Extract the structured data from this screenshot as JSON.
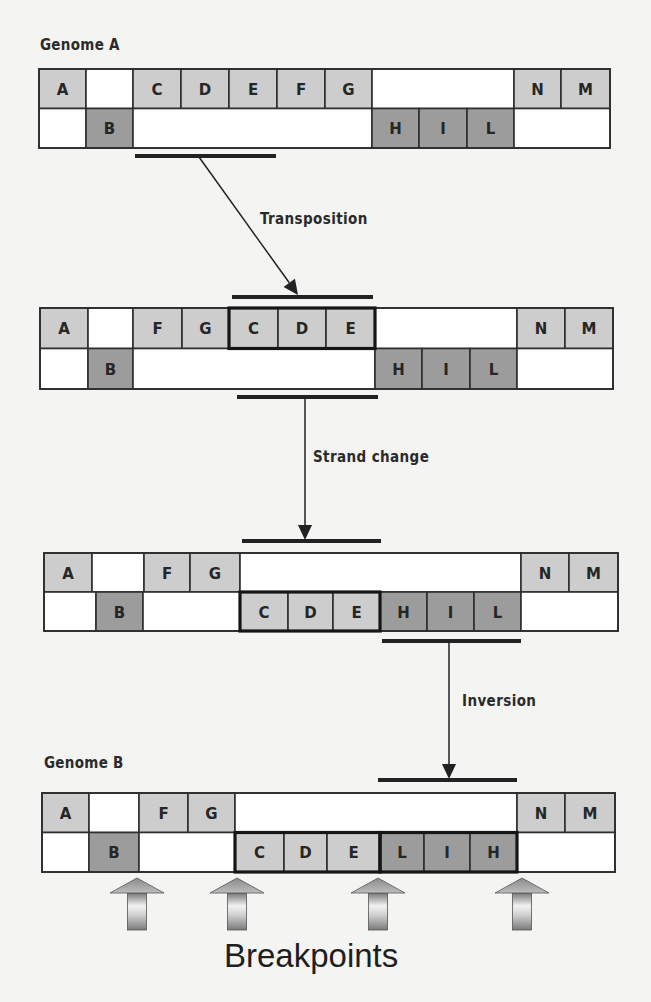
{
  "colors": {
    "light_cell": "#cdcdcd",
    "dark_cell": "#9c9c9c",
    "empty_cell": "#ffffff",
    "border": "#2e2e2e",
    "background": "#f4f4f2"
  },
  "labels": {
    "genome_a": "Genome A",
    "genome_b": "Genome B",
    "transposition": "Transposition",
    "strand_change": "Strand change",
    "inversion": "Inversion",
    "breakpoints": "Breakpoints"
  },
  "genomes": [
    {
      "name": "genome-a",
      "x": 39,
      "y": 69,
      "row_h": 39.5,
      "right": 610,
      "top_row": [
        {
          "x": 39,
          "w": 47,
          "label": "A",
          "shade": "light"
        },
        {
          "x": 86,
          "w": 47,
          "label": "",
          "shade": "empty"
        },
        {
          "x": 133,
          "w": 48,
          "label": "C",
          "shade": "light"
        },
        {
          "x": 181,
          "w": 48,
          "label": "D",
          "shade": "light"
        },
        {
          "x": 229,
          "w": 48,
          "label": "E",
          "shade": "light"
        },
        {
          "x": 277,
          "w": 48,
          "label": "F",
          "shade": "light"
        },
        {
          "x": 325,
          "w": 47,
          "label": "G",
          "shade": "light"
        },
        {
          "x": 372,
          "w": 142,
          "label": "",
          "shade": "empty"
        },
        {
          "x": 514,
          "w": 47,
          "label": "N",
          "shade": "light"
        },
        {
          "x": 561,
          "w": 49,
          "label": "M",
          "shade": "light"
        }
      ],
      "bottom_row": [
        {
          "x": 39,
          "w": 47,
          "label": "",
          "shade": "empty"
        },
        {
          "x": 86,
          "w": 47,
          "label": "B",
          "shade": "dark"
        },
        {
          "x": 133,
          "w": 239,
          "label": "",
          "shade": "empty"
        },
        {
          "x": 372,
          "w": 47,
          "label": "H",
          "shade": "dark"
        },
        {
          "x": 419,
          "w": 48,
          "label": "I",
          "shade": "dark"
        },
        {
          "x": 467,
          "w": 47,
          "label": "L",
          "shade": "dark"
        },
        {
          "x": 514,
          "w": 96,
          "label": "",
          "shade": "empty"
        }
      ],
      "bold_groups": []
    },
    {
      "name": "intermediate-1",
      "x": 40,
      "y": 308,
      "row_h": 40.5,
      "right": 613,
      "top_row": [
        {
          "x": 40,
          "w": 48,
          "label": "A",
          "shade": "light"
        },
        {
          "x": 88,
          "w": 45,
          "label": "",
          "shade": "empty"
        },
        {
          "x": 133,
          "w": 49,
          "label": "F",
          "shade": "light"
        },
        {
          "x": 182,
          "w": 47,
          "label": "G",
          "shade": "light"
        },
        {
          "x": 229,
          "w": 49,
          "label": "C",
          "shade": "light"
        },
        {
          "x": 278,
          "w": 48,
          "label": "D",
          "shade": "light"
        },
        {
          "x": 326,
          "w": 49,
          "label": "E",
          "shade": "light"
        },
        {
          "x": 375,
          "w": 142,
          "label": "",
          "shade": "empty"
        },
        {
          "x": 517,
          "w": 48,
          "label": "N",
          "shade": "light"
        },
        {
          "x": 565,
          "w": 48,
          "label": "M",
          "shade": "light"
        }
      ],
      "bottom_row": [
        {
          "x": 40,
          "w": 48,
          "label": "",
          "shade": "empty"
        },
        {
          "x": 88,
          "w": 45,
          "label": "B",
          "shade": "dark"
        },
        {
          "x": 133,
          "w": 242,
          "label": "",
          "shade": "empty"
        },
        {
          "x": 375,
          "w": 47,
          "label": "H",
          "shade": "dark"
        },
        {
          "x": 422,
          "w": 48,
          "label": "I",
          "shade": "dark"
        },
        {
          "x": 470,
          "w": 47,
          "label": "L",
          "shade": "dark"
        },
        {
          "x": 517,
          "w": 96,
          "label": "",
          "shade": "empty"
        }
      ],
      "bold_groups": [
        {
          "x": 229,
          "w": 146,
          "row": "top"
        }
      ]
    },
    {
      "name": "intermediate-2",
      "x": 44,
      "y": 553,
      "row_h": 39,
      "right": 618,
      "top_row": [
        {
          "x": 44,
          "w": 48,
          "label": "A",
          "shade": "light"
        },
        {
          "x": 92,
          "w": 52,
          "label": "",
          "shade": "empty"
        },
        {
          "x": 144,
          "w": 46,
          "label": "F",
          "shade": "light"
        },
        {
          "x": 190,
          "w": 50,
          "label": "G",
          "shade": "light"
        },
        {
          "x": 240,
          "w": 281,
          "label": "",
          "shade": "empty"
        },
        {
          "x": 521,
          "w": 48,
          "label": "N",
          "shade": "light"
        },
        {
          "x": 569,
          "w": 49,
          "label": "M",
          "shade": "light"
        }
      ],
      "bottom_row": [
        {
          "x": 44,
          "w": 52,
          "label": "",
          "shade": "empty"
        },
        {
          "x": 96,
          "w": 47,
          "label": "B",
          "shade": "dark"
        },
        {
          "x": 143,
          "w": 97,
          "label": "",
          "shade": "empty"
        },
        {
          "x": 240,
          "w": 48,
          "label": "C",
          "shade": "light"
        },
        {
          "x": 288,
          "w": 45,
          "label": "D",
          "shade": "light"
        },
        {
          "x": 333,
          "w": 47,
          "label": "E",
          "shade": "light"
        },
        {
          "x": 380,
          "w": 47,
          "label": "H",
          "shade": "dark"
        },
        {
          "x": 427,
          "w": 47,
          "label": "I",
          "shade": "dark"
        },
        {
          "x": 474,
          "w": 47,
          "label": "L",
          "shade": "dark"
        },
        {
          "x": 521,
          "w": 97,
          "label": "",
          "shade": "empty"
        }
      ],
      "bold_groups": [
        {
          "x": 240,
          "w": 140,
          "row": "bottom"
        }
      ]
    },
    {
      "name": "genome-b",
      "x": 42,
      "y": 793,
      "row_h": 39.5,
      "right": 615,
      "top_row": [
        {
          "x": 42,
          "w": 47,
          "label": "A",
          "shade": "light"
        },
        {
          "x": 89,
          "w": 50,
          "label": "",
          "shade": "empty"
        },
        {
          "x": 139,
          "w": 49,
          "label": "F",
          "shade": "light"
        },
        {
          "x": 188,
          "w": 47,
          "label": "G",
          "shade": "light"
        },
        {
          "x": 235,
          "w": 282,
          "label": "",
          "shade": "empty"
        },
        {
          "x": 517,
          "w": 48,
          "label": "N",
          "shade": "light"
        },
        {
          "x": 565,
          "w": 50,
          "label": "M",
          "shade": "light"
        }
      ],
      "bottom_row": [
        {
          "x": 42,
          "w": 47,
          "label": "",
          "shade": "empty"
        },
        {
          "x": 89,
          "w": 50,
          "label": "B",
          "shade": "dark"
        },
        {
          "x": 139,
          "w": 96,
          "label": "",
          "shade": "empty"
        },
        {
          "x": 235,
          "w": 49,
          "label": "C",
          "shade": "light"
        },
        {
          "x": 284,
          "w": 43,
          "label": "D",
          "shade": "light"
        },
        {
          "x": 327,
          "w": 53,
          "label": "E",
          "shade": "light"
        },
        {
          "x": 380,
          "w": 44,
          "label": "L",
          "shade": "dark"
        },
        {
          "x": 424,
          "w": 46,
          "label": "I",
          "shade": "dark"
        },
        {
          "x": 470,
          "w": 47,
          "label": "H",
          "shade": "dark"
        },
        {
          "x": 517,
          "w": 98,
          "label": "",
          "shade": "empty"
        }
      ],
      "bold_groups": [
        {
          "x": 235,
          "w": 145,
          "row": "bottom"
        },
        {
          "x": 380,
          "w": 137,
          "row": "bottom"
        }
      ]
    }
  ],
  "markers": [
    {
      "x1": 135,
      "x2": 276,
      "y": 156
    },
    {
      "x1": 232,
      "x2": 373,
      "y": 297
    },
    {
      "x1": 237,
      "x2": 378,
      "y": 397
    },
    {
      "x1": 242,
      "x2": 381,
      "y": 541
    },
    {
      "x1": 382,
      "x2": 521,
      "y": 641
    },
    {
      "x1": 378,
      "x2": 517,
      "y": 780
    }
  ],
  "arrows": [
    {
      "x1": 199,
      "y1": 157,
      "x2": 298,
      "y2": 295
    },
    {
      "x1": 305,
      "y1": 398,
      "x2": 305,
      "y2": 540
    },
    {
      "x1": 449,
      "y1": 642,
      "x2": 449,
      "y2": 779
    }
  ],
  "breakpoint_arrows": [
    137,
    237,
    378,
    522
  ]
}
